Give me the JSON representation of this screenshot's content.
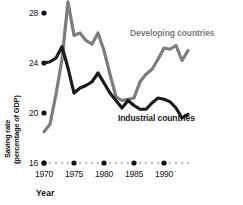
{
  "chart_data": {
    "type": "line",
    "title": "",
    "xlabel": "Year",
    "ylabel": "Saving rate (percentage of GDP)",
    "ylabel_line1": "Saving rate",
    "ylabel_line2": "(percentage of GDP)",
    "xlim": [
      1970,
      1994
    ],
    "ylim": [
      16,
      28
    ],
    "yticks": [
      28,
      24,
      20,
      16
    ],
    "ytick_labels": [
      "28",
      "24",
      "20",
      "16"
    ],
    "xticks": [
      1970,
      1975,
      1980,
      1985,
      1990
    ],
    "xtick_labels": [
      "1970",
      "1975",
      "1980",
      "1985",
      "1990"
    ],
    "minor_xticks": [
      1971,
      1972,
      1973,
      1974,
      1976,
      1977,
      1978,
      1979,
      1981,
      1982,
      1983,
      1984,
      1986,
      1987,
      1988,
      1989,
      1991,
      1992,
      1993,
      1994
    ],
    "grid": false,
    "legend_position": "inline-annotation",
    "x": [
      1970,
      1971,
      1972,
      1973,
      1974,
      1975,
      1976,
      1977,
      1978,
      1979,
      1980,
      1981,
      1982,
      1983,
      1984,
      1985,
      1986,
      1987,
      1988,
      1989,
      1990,
      1991,
      1992,
      1993,
      1994
    ],
    "series": [
      {
        "name": "Developing countries",
        "color": "#7d7d7d",
        "values": [
          18.5,
          19.1,
          21.5,
          24.3,
          28.9,
          26.2,
          26.4,
          25.8,
          25.5,
          26.4,
          25.0,
          23.1,
          21.3,
          21.0,
          21.1,
          21.2,
          22.5,
          23.1,
          23.5,
          24.3,
          25.2,
          25.1,
          25.4,
          24.2,
          25.0
        ]
      },
      {
        "name": "Industrial countries",
        "color": "#1a1a1a",
        "values": [
          24.0,
          24.1,
          24.4,
          25.3,
          23.6,
          21.6,
          22.0,
          22.2,
          22.5,
          23.2,
          22.4,
          21.6,
          21.0,
          20.4,
          21.0,
          20.6,
          20.3,
          20.3,
          20.8,
          21.2,
          21.1,
          20.9,
          20.4,
          19.6,
          19.9
        ]
      }
    ]
  },
  "annotations": {
    "developing_label": "Developing countries",
    "industrial_label": "Industrial countries"
  }
}
